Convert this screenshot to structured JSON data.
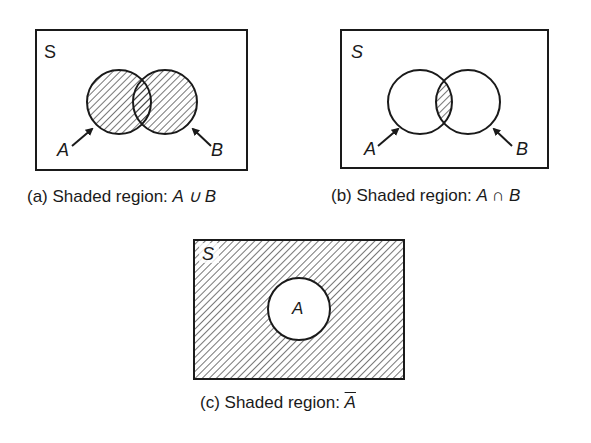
{
  "diagrams": [
    {
      "id": "a",
      "caption_prefix": "(a)",
      "caption_text": "Shaded region: ",
      "caption_expr": "A ∪ B",
      "universe_label": "S",
      "set_labels": [
        "A",
        "B"
      ],
      "shaded": "union"
    },
    {
      "id": "b",
      "caption_prefix": "(b)",
      "caption_text": "Shaded region: ",
      "caption_expr": "A ∩ B",
      "universe_label": "S",
      "set_labels": [
        "A",
        "B"
      ],
      "shaded": "intersection"
    },
    {
      "id": "c",
      "caption_prefix": "(c)",
      "caption_text": "Shaded region: ",
      "caption_expr": "A",
      "caption_expr_overline": true,
      "universe_label": "S",
      "set_labels": [
        "A"
      ],
      "shaded": "complement"
    }
  ],
  "colors": {
    "line": "#1a1a1a",
    "background": "#ffffff"
  }
}
